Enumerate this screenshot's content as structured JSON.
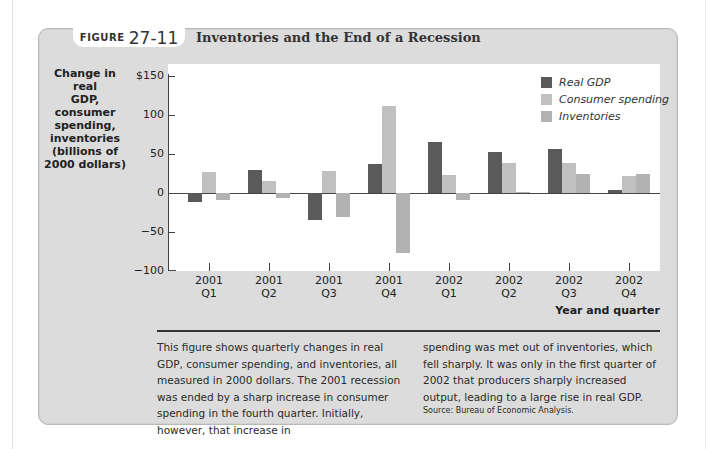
{
  "figure": {
    "label_word": "FIGURE",
    "label_number": "27-11",
    "title": "Inventories and the End of a Recession"
  },
  "colors": {
    "real_gdp": "#5a5a5a",
    "consumer_spending": "#c0c0c0",
    "inventories": "#b2b2b2",
    "panel_background": "#dcdcdc",
    "plot_background": "#ffffff"
  },
  "chart_data": {
    "type": "bar",
    "title": "Inventories and the End of a Recession",
    "xlabel": "Year and quarter",
    "ylabel": "Change in real GDP, consumer spending, inventories (billions of 2000 dollars)",
    "ylim": [
      -100,
      150
    ],
    "yticks": [
      -100,
      -50,
      0,
      50,
      100,
      150
    ],
    "ytick_labels": [
      "−100",
      "−50",
      "0",
      "50",
      "100",
      "$150"
    ],
    "grid": false,
    "legend_position": "top-right",
    "categories": [
      "2001 Q1",
      "2001 Q2",
      "2001 Q3",
      "2001 Q4",
      "2002 Q1",
      "2002 Q2",
      "2002 Q3",
      "2002 Q4"
    ],
    "category_lines": [
      [
        "2001",
        "Q1"
      ],
      [
        "2001",
        "Q2"
      ],
      [
        "2001",
        "Q3"
      ],
      [
        "2001",
        "Q4"
      ],
      [
        "2002",
        "Q1"
      ],
      [
        "2002",
        "Q2"
      ],
      [
        "2002",
        "Q3"
      ],
      [
        "2002",
        "Q4"
      ]
    ],
    "series": [
      {
        "name": "Real GDP",
        "values": [
          -11,
          29,
          -35,
          37,
          65,
          52,
          56,
          4
        ]
      },
      {
        "name": "Consumer spending",
        "values": [
          27,
          15,
          28,
          112,
          23,
          39,
          38,
          22
        ]
      },
      {
        "name": "Inventories",
        "values": [
          -9,
          -7,
          -31,
          -77,
          -9,
          1,
          24,
          24
        ]
      }
    ]
  },
  "axis": {
    "y_title_lines": [
      "Change in real",
      "GDP, consumer",
      "spending,",
      "inventories",
      "(billions of",
      "2000 dollars)"
    ],
    "x_title": "Year and quarter"
  },
  "legend": [
    {
      "label": "Real GDP"
    },
    {
      "label": "Consumer spending"
    },
    {
      "label": "Inventories"
    }
  ],
  "caption": {
    "col1": "This figure shows quarterly changes in real GDP, consumer spending, and inventories, all measured in 2000 dollars. The 2001 recession was ended by a sharp increase in consumer spending in the fourth quarter. Initially, however, that increase in",
    "col2": "spending was met out of inventories, which fell sharply. It was only in the first quarter of 2002 that producers sharply increased output, leading to a large rise in real GDP.",
    "source": "Source: Bureau of Economic Analysis."
  }
}
